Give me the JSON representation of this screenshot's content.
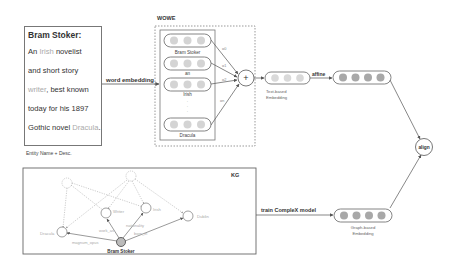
{
  "description_box": {
    "title": "Bram Stoker:",
    "lines": [
      {
        "pre": "An ",
        "link": "Irish",
        "post": " novelist"
      },
      {
        "pre": "and short story",
        "link": "",
        "post": ""
      },
      {
        "pre": "",
        "link": "writer",
        "post": ", best known"
      },
      {
        "pre": "today for his 1897",
        "link": "",
        "post": ""
      },
      {
        "pre": "Gothic novel ",
        "link": "Dracula",
        "post": "."
      }
    ],
    "caption": "Entity Name + Desc."
  },
  "wowe": {
    "title": "WOWE",
    "words": [
      "Bram Stoker",
      "an",
      "Irish",
      "Dracula"
    ],
    "ellipsis": "·\n·\n·",
    "weights": [
      "α0",
      "α1",
      "α2",
      "αn"
    ],
    "sum_symbol": "+"
  },
  "edges": {
    "word_embedding": "word embedding",
    "affine": "affine",
    "train_model": "train CompleX model"
  },
  "text_embedding": {
    "label_line1": "Text-based",
    "label_line2": "Embedding"
  },
  "graph_embedding": {
    "label_line1": "Graph-based",
    "label_line2": "Embedding"
  },
  "align": {
    "label": "align"
  },
  "kg": {
    "title": "KG",
    "center_node": "Bram Stoker",
    "nodes": [
      "Dracula",
      "Writer",
      "Irish",
      "Dublin"
    ],
    "relations": [
      "magnum_opus",
      "work_as",
      "nationality",
      "born_in"
    ]
  },
  "colors": {
    "light_dot": "#d4d4d4",
    "dark_dot": "#a8a8a8",
    "line": "#555555",
    "faint_text": "#aaaaaa"
  }
}
